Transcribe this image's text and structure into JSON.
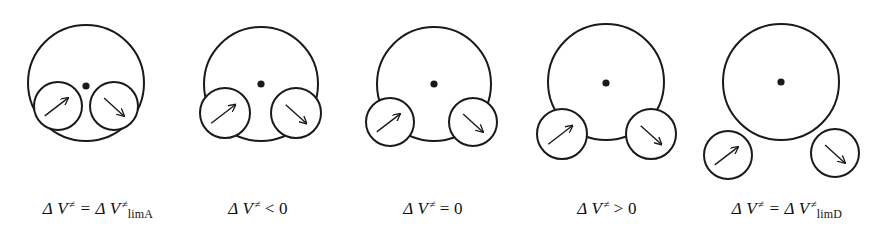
{
  "figure": {
    "stroke_color": "#1a1a1a",
    "background": "#ffffff"
  },
  "panels": [
    {
      "label": {
        "lhs": "Δ V",
        "sup": "≠",
        "op": " = Δ V",
        "op_sup": "≠",
        "sub": "limA",
        "rhs": ""
      },
      "big": {
        "cx": 86,
        "cy": 83,
        "r": 58
      },
      "dot": {
        "cx": 86,
        "cy": 86
      },
      "left": {
        "cx": 58,
        "cy": 106,
        "r": 24
      },
      "right": {
        "cx": 114,
        "cy": 106,
        "r": 24
      },
      "label_x": 98
    },
    {
      "label": {
        "lhs": "Δ V",
        "sup": "≠",
        "op": " < 0",
        "op_sup": "",
        "sub": "",
        "rhs": ""
      },
      "big": {
        "cx": 261,
        "cy": 84,
        "r": 57
      },
      "dot": {
        "cx": 261,
        "cy": 84
      },
      "left": {
        "cx": 225,
        "cy": 113,
        "r": 25
      },
      "right": {
        "cx": 296,
        "cy": 113,
        "r": 25
      },
      "label_x": 258
    },
    {
      "label": {
        "lhs": "Δ V",
        "sup": "≠",
        "op": " = 0",
        "op_sup": "",
        "sub": "",
        "rhs": ""
      },
      "big": {
        "cx": 434,
        "cy": 84,
        "r": 57
      },
      "dot": {
        "cx": 434,
        "cy": 84
      },
      "left": {
        "cx": 390,
        "cy": 122,
        "r": 24
      },
      "right": {
        "cx": 473,
        "cy": 122,
        "r": 24
      },
      "label_x": 433
    },
    {
      "label": {
        "lhs": "Δ V",
        "sup": "≠",
        "op": " > 0",
        "op_sup": "",
        "sub": "",
        "rhs": ""
      },
      "big": {
        "cx": 606,
        "cy": 82,
        "r": 58
      },
      "dot": {
        "cx": 606,
        "cy": 83
      },
      "left": {
        "cx": 562,
        "cy": 134,
        "r": 25
      },
      "right": {
        "cx": 651,
        "cy": 134,
        "r": 25
      },
      "label_x": 607
    },
    {
      "label": {
        "lhs": "Δ V",
        "sup": "≠",
        "op": " = Δ V",
        "op_sup": "≠",
        "sub": "limD",
        "rhs": ""
      },
      "big": {
        "cx": 781,
        "cy": 82,
        "r": 58
      },
      "dot": {
        "cx": 781,
        "cy": 82
      },
      "left": {
        "cx": 728,
        "cy": 155,
        "r": 24
      },
      "right": {
        "cx": 835,
        "cy": 153,
        "r": 24
      },
      "label_x": 787
    }
  ],
  "labels": [
    {
      "text": "Δ V≠ = Δ V≠limA",
      "parts": {
        "a": "Δ V",
        "a_sup": "≠",
        "mid": " = Δ V",
        "mid_sup": "≠",
        "sub": "limA"
      }
    },
    {
      "text": "Δ V≠ < 0",
      "parts": {
        "a": "Δ V",
        "a_sup": "≠",
        "mid": " < 0",
        "mid_sup": "",
        "sub": ""
      }
    },
    {
      "text": "Δ V≠ = 0",
      "parts": {
        "a": "Δ V",
        "a_sup": "≠",
        "mid": " = 0",
        "mid_sup": "",
        "sub": ""
      }
    },
    {
      "text": "Δ V≠ > 0",
      "parts": {
        "a": "Δ V",
        "a_sup": "≠",
        "mid": " > 0",
        "mid_sup": "",
        "sub": ""
      }
    },
    {
      "text": "Δ V≠ = Δ V≠limD",
      "parts": {
        "a": "Δ V",
        "a_sup": "≠",
        "mid": " = Δ V",
        "mid_sup": "≠",
        "sub": "limD"
      }
    }
  ]
}
